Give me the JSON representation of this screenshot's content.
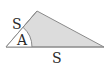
{
  "diagram": {
    "labels": {
      "left_side": "S",
      "angle": "A",
      "base": "S"
    },
    "colors": {
      "fill": "#dcdcdc",
      "stroke": "#8a8a8a",
      "angle_region": "#ffffff",
      "text": "#2a2a2a"
    }
  }
}
